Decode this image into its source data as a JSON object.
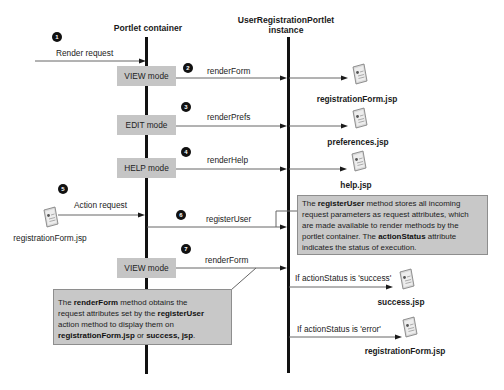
{
  "lifelines": {
    "container": {
      "title": "Portlet container"
    },
    "instance": {
      "title_line1": "UserRegistrationPortlet",
      "title_line2": "instance"
    }
  },
  "steps": [
    "1",
    "2",
    "3",
    "4",
    "5",
    "6",
    "7"
  ],
  "modes": {
    "view_1": "VIEW mode",
    "edit": "EDIT mode",
    "help": "HELP mode",
    "view_2": "VIEW mode"
  },
  "messages": {
    "render_request": "Render request",
    "render_form_1": "renderForm",
    "render_prefs": "renderPrefs",
    "render_help": "renderHelp",
    "action_request": "Action request",
    "register_user": "registerUser",
    "render_form_2": "renderForm",
    "if_success": "If actionStatus is 'success'",
    "if_error": "If actionStatus is 'error'"
  },
  "files": {
    "registration_form_view": "registrationForm.jsp",
    "preferences": "preferences.jsp",
    "help": "help.jsp",
    "registration_form_action": "registrationForm.jsp",
    "success": "success.jsp",
    "registration_form_error": "registrationForm.jsp"
  },
  "notes": {
    "register_user": {
      "l1a": "The ",
      "l1b": "registerUser",
      "l1c": " method stores all incoming",
      "l2": "request parameters as request attributes, which",
      "l3": "are made available to render methods by the",
      "l4a": "portlet container. The ",
      "l4b": "actionStatus",
      "l4c": " attribute",
      "l5": "indicates the status of execution."
    },
    "render_form": {
      "l1a": "The ",
      "l1b": "renderForm",
      "l1c": " method obtains the",
      "l2a": "request attributes set by the ",
      "l2b": "registerUser",
      "l3": "action method to display them on",
      "l4a": "registrationForm.jsp",
      "l4b": " or ",
      "l4c": "success, jsp",
      "l4d": "."
    }
  },
  "colors": {
    "box_fill": "#c5c5c5",
    "note_fill": "#c8c8c8",
    "note_border": "#8e8e8e",
    "lifeline": "#111111",
    "arrow": "#555555"
  }
}
